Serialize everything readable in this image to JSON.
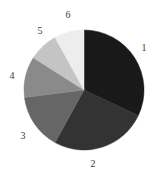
{
  "figure": {
    "background_color": "#ffffff",
    "label_color": "#3a3a3a"
  },
  "chart_data": {
    "type": "pie",
    "title": "",
    "subtitle": "",
    "xlabel": "",
    "ylabel": "",
    "grid": false,
    "legend_position": "none",
    "label_placement": "outside",
    "start_angle_deg": 0,
    "direction": "clockwise",
    "center_px": [
      84,
      90
    ],
    "radius_px": 60,
    "categories": [
      "1",
      "2",
      "3",
      "4",
      "5",
      "6"
    ],
    "values": [
      32,
      26,
      15,
      11,
      8,
      8
    ],
    "percentages": [
      "32%",
      "26%",
      "15%",
      "11%",
      "8%",
      "8%"
    ],
    "colors": [
      "#191919",
      "#333333",
      "#666666",
      "#8a8a8a",
      "#c4c4c4",
      "#ededed"
    ],
    "slices": [
      {
        "label": "1",
        "value": 32,
        "percent": "32%",
        "color": "#191919",
        "start_angle_deg": 0,
        "end_angle_deg": 115.2,
        "label_x": 144,
        "label_y": 48
      },
      {
        "label": "2",
        "value": 26,
        "percent": "26%",
        "color": "#333333",
        "start_angle_deg": 115.2,
        "end_angle_deg": 208.8,
        "label_x": 93,
        "label_y": 164
      },
      {
        "label": "3",
        "value": 15,
        "percent": "15%",
        "color": "#666666",
        "start_angle_deg": 208.8,
        "end_angle_deg": 262.8,
        "label_x": 23,
        "label_y": 136
      },
      {
        "label": "4",
        "value": 11,
        "percent": "11%",
        "color": "#8a8a8a",
        "start_angle_deg": 262.8,
        "end_angle_deg": 302.4,
        "label_x": 12,
        "label_y": 76
      },
      {
        "label": "5",
        "value": 8,
        "percent": "8%",
        "color": "#c4c4c4",
        "start_angle_deg": 302.4,
        "end_angle_deg": 331.2,
        "label_x": 40,
        "label_y": 31
      },
      {
        "label": "6",
        "value": 8,
        "percent": "8%",
        "color": "#ededed",
        "start_angle_deg": 331.2,
        "end_angle_deg": 360,
        "label_x": 68,
        "label_y": 15
      }
    ]
  }
}
